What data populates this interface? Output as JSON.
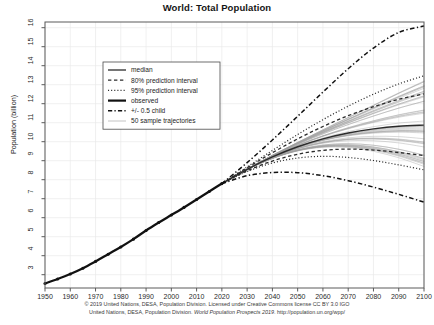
{
  "chart_data": {
    "type": "line",
    "title": "World: Total Population",
    "xlabel": "",
    "ylabel": "Population (billion)",
    "xlim": [
      1950,
      2100
    ],
    "ylim": [
      2.3,
      16.3
    ],
    "grid": true,
    "legend_position": "upper-left",
    "x_ticks": [
      1950,
      1960,
      1970,
      1980,
      1990,
      2000,
      2010,
      2020,
      2030,
      2040,
      2050,
      2060,
      2070,
      2080,
      2090,
      2100
    ],
    "y_ticks": [
      3,
      4,
      5,
      6,
      7,
      8,
      9,
      10,
      11,
      12,
      13,
      14,
      15,
      16
    ],
    "legend": [
      {
        "label": "median",
        "style": "solid",
        "color": "#2b2b2b",
        "width": 1.3
      },
      {
        "label": "80% prediction interval",
        "style": "dashed",
        "color": "#2b2b2b",
        "width": 1.3
      },
      {
        "label": "95% prediction interval",
        "style": "dotted",
        "color": "#2b2b2b",
        "width": 1.2
      },
      {
        "label": "observed",
        "style": "solid",
        "color": "#111111",
        "width": 2.2
      },
      {
        "label": "+/- 0.5 child",
        "style": "dashdot",
        "color": "#111111",
        "width": 1.4
      },
      {
        "label": "50 sample trajectories",
        "style": "solid",
        "color": "#9a9a9a",
        "width": 0.6
      }
    ],
    "series": [
      {
        "name": "observed",
        "style": "solid",
        "color": "#111111",
        "width": 2.3,
        "markers": true,
        "x": [
          1950,
          1955,
          1960,
          1965,
          1970,
          1975,
          1980,
          1985,
          1990,
          1995,
          2000,
          2005,
          2010,
          2015,
          2020
        ],
        "values": [
          2.536,
          2.773,
          3.035,
          3.34,
          3.7,
          4.079,
          4.458,
          4.871,
          5.327,
          5.744,
          6.143,
          6.542,
          6.957,
          7.38,
          7.795
        ]
      },
      {
        "name": "median",
        "style": "solid",
        "color": "#2b2b2b",
        "width": 1.4,
        "x": [
          2020,
          2030,
          2040,
          2050,
          2060,
          2070,
          2080,
          2090,
          2100
        ],
        "values": [
          7.795,
          8.548,
          9.199,
          9.735,
          10.152,
          10.459,
          10.674,
          10.817,
          10.875
        ]
      },
      {
        "name": "80% prediction interval upper",
        "style": "dashed",
        "color": "#2b2b2b",
        "width": 1.3,
        "x": [
          2020,
          2030,
          2040,
          2050,
          2060,
          2070,
          2080,
          2090,
          2100
        ],
        "values": [
          7.795,
          8.629,
          9.42,
          10.15,
          10.8,
          11.37,
          11.84,
          12.23,
          12.52
        ]
      },
      {
        "name": "80% prediction interval lower",
        "style": "dashed",
        "color": "#2b2b2b",
        "width": 1.3,
        "x": [
          2020,
          2030,
          2040,
          2050,
          2060,
          2070,
          2080,
          2090,
          2100
        ],
        "values": [
          7.795,
          8.468,
          8.983,
          9.34,
          9.545,
          9.61,
          9.56,
          9.43,
          9.27
        ]
      },
      {
        "name": "95% prediction interval upper",
        "style": "dotted",
        "color": "#2b2b2b",
        "width": 1.2,
        "x": [
          2020,
          2030,
          2040,
          2050,
          2060,
          2070,
          2080,
          2090,
          2100
        ],
        "values": [
          7.795,
          8.672,
          9.54,
          10.38,
          11.16,
          11.87,
          12.5,
          13.04,
          13.47
        ]
      },
      {
        "name": "95% prediction interval lower",
        "style": "dotted",
        "color": "#2b2b2b",
        "width": 1.2,
        "x": [
          2020,
          2030,
          2040,
          2050,
          2060,
          2070,
          2080,
          2090,
          2100
        ],
        "values": [
          7.795,
          8.43,
          8.88,
          9.14,
          9.23,
          9.17,
          9.01,
          8.78,
          8.52
        ]
      },
      {
        "name": "+0.5 child",
        "style": "dashdot",
        "color": "#111111",
        "width": 1.5,
        "x": [
          2020,
          2030,
          2040,
          2050,
          2060,
          2070,
          2080,
          2090,
          2100
        ],
        "values": [
          7.795,
          8.9,
          10.09,
          11.34,
          12.61,
          13.84,
          14.93,
          15.75,
          16.09
        ]
      },
      {
        "name": "-0.5 child",
        "style": "dashdot",
        "color": "#111111",
        "width": 1.5,
        "x": [
          2020,
          2030,
          2040,
          2050,
          2060,
          2070,
          2080,
          2090,
          2100
        ],
        "values": [
          7.795,
          8.21,
          8.38,
          8.37,
          8.21,
          7.95,
          7.61,
          7.23,
          6.82
        ]
      }
    ],
    "sample_trajectories_count": 50,
    "sample_trajectories_color": "#9e9e9e",
    "sample_trajectories_endpoints_range": [
      9.2,
      12.6
    ]
  },
  "caption": {
    "line1": "© 2019 United Nations, DESA, Population Division. Licensed under Creative Commons license CC BY 3.0 IGO",
    "line2_a": "United Nations, DESA, Population Division. ",
    "line2_italic": "World Population Prospects 2019",
    "line2_b": ". http://population.un.org/wpp/"
  }
}
